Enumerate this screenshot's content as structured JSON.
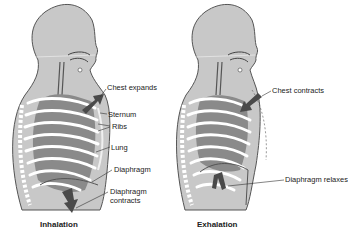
{
  "panels": [
    {
      "caption": "Inhalation",
      "labels": {
        "chest": "Chest expands",
        "sternum": "Sternum",
        "ribs": "Ribs",
        "lung": "Lung",
        "diaphragm": "Diaphragm",
        "diaphragm_action_1": "Diaphragm",
        "diaphragm_action_2": "contracts"
      }
    },
    {
      "caption": "Exhalation",
      "labels": {
        "chest": "Chest contracts",
        "diaphragm_action": "Diaphragm relaxes"
      }
    }
  ],
  "colors": {
    "body": "#c8c8c8",
    "outline": "#555555",
    "lung": "#8a8a8a",
    "rib": "#ffffff",
    "arrow": "#4a4a4a"
  }
}
